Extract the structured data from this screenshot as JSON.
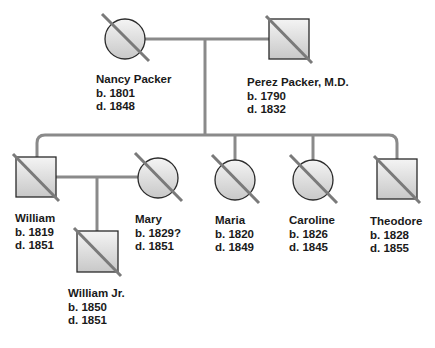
{
  "diagram": {
    "type": "pedigree-chart",
    "colors": {
      "line": "#8a8a8a",
      "outline": "#2a2a2a",
      "fill_top": "#f4f4f4",
      "fill_bottom": "#c8c8c8",
      "deceased_slash": "#7a7a7a",
      "text": "#1a1a1a"
    },
    "people": [
      {
        "id": "nancy",
        "name": "Nancy Packer",
        "born": "b. 1801",
        "died": "d. 1848",
        "sex": "female",
        "deceased": true
      },
      {
        "id": "perez",
        "name": "Perez Packer, M.D.",
        "born": "b. 1790",
        "died": "d. 1832",
        "sex": "male",
        "deceased": true
      },
      {
        "id": "william",
        "name": "William",
        "born": "b. 1819",
        "died": "d. 1851",
        "sex": "male",
        "deceased": true
      },
      {
        "id": "mary",
        "name": "Mary",
        "born": "b. 1829?",
        "died": "d. 1851",
        "sex": "female",
        "deceased": true
      },
      {
        "id": "maria",
        "name": "Maria",
        "born": "b. 1820",
        "died": "d. 1849",
        "sex": "female",
        "deceased": true
      },
      {
        "id": "caroline",
        "name": "Caroline",
        "born": "b. 1826",
        "died": "d. 1845",
        "sex": "female",
        "deceased": true
      },
      {
        "id": "theodore",
        "name": "Theodore",
        "born": "b. 1828",
        "died": "d. 1855",
        "sex": "male",
        "deceased": true
      },
      {
        "id": "william_jr",
        "name": "William Jr.",
        "born": "b. 1850",
        "died": "d. 1851",
        "sex": "male",
        "deceased": true
      }
    ],
    "relationships": [
      {
        "type": "marriage",
        "between": [
          "nancy",
          "perez"
        ],
        "children": [
          "william",
          "maria",
          "caroline",
          "theodore"
        ]
      },
      {
        "type": "marriage",
        "between": [
          "william",
          "mary"
        ],
        "children": [
          "william_jr"
        ]
      }
    ]
  }
}
